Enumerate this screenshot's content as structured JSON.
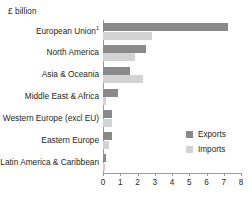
{
  "chart_data": {
    "type": "bar",
    "orientation": "horizontal",
    "title": "",
    "unit_label": "£ billion",
    "xlabel": "",
    "ylabel": "",
    "xlim": [
      0,
      8
    ],
    "grid": false,
    "legend_position": "middle-right",
    "categories": [
      "European Union",
      "North America",
      "Asia & Oceania",
      "Middle East & Africa",
      "Western Europe (excl EU)",
      "Eastern Europe",
      "Latin America & Caribbean"
    ],
    "category_footnotes": [
      "1",
      "",
      "",
      "",
      "",
      "",
      ""
    ],
    "series": [
      {
        "name": "Exports",
        "color": "#8a8a8a",
        "values": [
          7.25,
          2.5,
          1.55,
          0.85,
          0.55,
          0.5,
          0.2
        ]
      },
      {
        "name": "Imports",
        "color": "#d3d3d3",
        "values": [
          2.85,
          1.85,
          2.3,
          0.2,
          0.5,
          0.35,
          0.1
        ]
      }
    ],
    "xticks": [
      0,
      1,
      2,
      3,
      4,
      5,
      6,
      7,
      8
    ],
    "xtick_labels": [
      "0",
      "1",
      "2",
      "3",
      "4",
      "5",
      "6",
      "7",
      "8"
    ]
  },
  "legend": {
    "items": [
      {
        "label": "Exports",
        "key": "exports"
      },
      {
        "label": "Imports",
        "key": "imports"
      }
    ]
  }
}
